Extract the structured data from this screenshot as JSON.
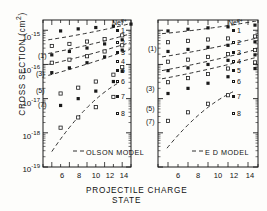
{
  "chart_data": {
    "type": "scatter",
    "title": "",
    "xlabel": "PROJECTILE CHARGE STATE",
    "ylabel": "CROSS SECTION (cm2)",
    "ylabel_display": "CROSS SECTION (cm",
    "ylabel_sup": "2",
    "ylabel_tail": ")",
    "xlim": [
      5,
      15
    ],
    "ylim_log": [
      -19,
      -14.7
    ],
    "xticks": [
      6,
      8,
      10,
      12,
      14
    ],
    "xtick_labels": [
      "6",
      "8",
      "10",
      "12",
      "14"
    ],
    "yticks_exponent": [
      -15,
      -16,
      -17,
      -18,
      -19
    ],
    "ytick_labels": [
      "10",
      "10",
      "10",
      "10",
      "10"
    ],
    "ytick_exponents": [
      "-15",
      "-16",
      "-17",
      "-18",
      "-19"
    ],
    "grid": false,
    "legend_position": "top-right-inside",
    "legend_title": "Ne",
    "legend_title_sup": "q+",
    "legend_entries": [
      {
        "label": "1",
        "marker": "filled"
      },
      {
        "label": "2",
        "marker": "open"
      },
      {
        "label": "3",
        "marker": "filled"
      },
      {
        "label": "4",
        "marker": "open"
      },
      {
        "label": "5",
        "marker": "filled"
      },
      {
        "label": "6",
        "marker": "open"
      },
      {
        "label": "7",
        "marker": "filled"
      },
      {
        "label": "8",
        "marker": "open"
      }
    ],
    "panels": [
      {
        "name": "left-panel",
        "model_label": "OLSON MODEL",
        "curve_labels": [
          "(1)",
          "(3)",
          "(5)",
          "(7)"
        ],
        "series": [
          {
            "name": "1",
            "marker": "filled",
            "x": [
              7,
              9,
              11,
              13,
              15
            ],
            "y_log": [
              -15.02,
              -14.96,
              -14.92,
              -14.88,
              -14.82
            ]
          },
          {
            "name": "2",
            "marker": "open",
            "x": [
              6,
              8,
              10,
              12,
              14
            ],
            "y_log": [
              -15.46,
              -15.4,
              -15.33,
              -15.26,
              -15.15
            ]
          },
          {
            "name": "3",
            "marker": "filled",
            "x": [
              6,
              8,
              10,
              12,
              14
            ],
            "y_log": [
              -15.72,
              -15.62,
              -15.52,
              -15.4,
              -15.28
            ]
          },
          {
            "name": "4",
            "marker": "open",
            "x": [
              6,
              8,
              10,
              12,
              14
            ],
            "y_log": [
              -15.95,
              -15.86,
              -15.76,
              -15.62,
              -15.44
            ]
          },
          {
            "name": "5",
            "marker": "filled",
            "x": [
              6,
              8,
              10,
              12,
              14
            ],
            "y_log": [
              -16.24,
              -16.1,
              -15.95,
              -15.78,
              -15.58
            ]
          },
          {
            "name": "6",
            "marker": "open",
            "x": [
              7,
              9,
              11,
              13,
              14
            ],
            "y_log": [
              -16.85,
              -16.68,
              -16.5,
              -16.3,
              -16.08
            ]
          },
          {
            "name": "7",
            "marker": "filled",
            "x": [
              7,
              9,
              11,
              13,
              14
            ],
            "y_log": [
              -17.2,
              -17.0,
              -16.78,
              -16.5,
              -16.2
            ]
          },
          {
            "name": "8",
            "marker": "open",
            "x": [
              7,
              9,
              11,
              13
            ],
            "y_log": [
              -17.85,
              -17.55,
              -17.25,
              -16.95
            ]
          }
        ],
        "model_curves": [
          {
            "label": "(1)",
            "x": [
              5.6,
              15
            ],
            "y_log": [
              -15.28,
              -14.8
            ]
          },
          {
            "label": "(3)",
            "x": [
              5.6,
              15
            ],
            "y_log": [
              -15.68,
              -15.1
            ]
          },
          {
            "label": "(5)",
            "x": [
              5.6,
              15
            ],
            "y_log": [
              -16.0,
              -15.35
            ]
          },
          {
            "label": "(7)",
            "x": [
              5.6,
              15
            ],
            "y_log": [
              -16.32,
              -15.55
            ]
          },
          {
            "label": "",
            "x": [
              6.0,
              13.5
            ],
            "y_log": [
              -18.55,
              -16.55
            ]
          }
        ]
      },
      {
        "name": "right-panel",
        "model_label": "E D MODEL",
        "curve_labels": [
          "(1)",
          "(3)",
          "(5)",
          "(7)"
        ],
        "series": [
          {
            "name": "1",
            "marker": "filled",
            "x": [
              6,
              8,
              10,
              12,
              14.7
            ],
            "y_log": [
              -15.02,
              -14.97,
              -14.93,
              -14.9,
              -14.85
            ]
          },
          {
            "name": "2",
            "marker": "open",
            "x": [
              6,
              8,
              10,
              12,
              14.7
            ],
            "y_log": [
              -15.35,
              -15.31,
              -15.27,
              -15.24,
              -15.18
            ]
          },
          {
            "name": "3",
            "marker": "filled",
            "x": [
              6,
              8,
              10,
              12,
              14.7
            ],
            "y_log": [
              -15.62,
              -15.56,
              -15.5,
              -15.44,
              -15.34
            ]
          },
          {
            "name": "4",
            "marker": "open",
            "x": [
              6,
              8,
              10,
              12,
              14.7
            ],
            "y_log": [
              -15.92,
              -15.86,
              -15.78,
              -15.7,
              -15.58
            ]
          },
          {
            "name": "5",
            "marker": "filled",
            "x": [
              6,
              8,
              10,
              12,
              14.7
            ],
            "y_log": [
              -16.18,
              -16.1,
              -16.0,
              -15.88,
              -15.72
            ]
          },
          {
            "name": "6",
            "marker": "open",
            "x": [
              6,
              8,
              10,
              12,
              14.7
            ],
            "y_log": [
              -16.52,
              -16.4,
              -16.28,
              -16.12,
              -15.94
            ]
          },
          {
            "name": "7",
            "marker": "filled",
            "x": [
              6,
              8,
              10,
              12,
              14.7
            ],
            "y_log": [
              -16.85,
              -16.7,
              -16.55,
              -16.36,
              -16.12
            ]
          },
          {
            "name": "8",
            "marker": "open",
            "x": [
              6,
              8,
              10,
              12
            ],
            "y_log": [
              -17.65,
              -17.4,
              -17.15,
              -16.9
            ]
          }
        ],
        "model_curves": [
          {
            "label": "(1)",
            "x": [
              5.4,
              15
            ],
            "y_log": [
              -15.1,
              -14.72
            ]
          },
          {
            "label": "(3)",
            "x": [
              5.4,
              15
            ],
            "y_log": [
              -15.78,
              -15.22
            ]
          },
          {
            "label": "(5)",
            "x": [
              5.4,
              15
            ],
            "y_log": [
              -16.18,
              -15.55
            ]
          },
          {
            "label": "(7)",
            "x": [
              5.4,
              15
            ],
            "y_log": [
              -16.42,
              -15.78
            ]
          },
          {
            "label": "",
            "x": [
              5.9,
              12.5
            ],
            "y_log": [
              -18.45,
              -16.8
            ]
          }
        ]
      }
    ]
  }
}
